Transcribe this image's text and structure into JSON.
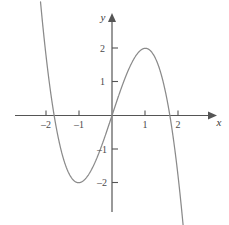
{
  "figure": {
    "background_color": "#ffffff",
    "axis_color": "#555555",
    "curve_color": "#8a8a8a",
    "tick_color": "#555555",
    "label_color": "#3a3a3a"
  },
  "axes": {
    "x_axis_label": "x",
    "y_axis_label": "y",
    "x_ticks": [
      {
        "label": "–2",
        "value": -2
      },
      {
        "label": "–1",
        "value": -1
      },
      {
        "label": "1",
        "value": 1
      },
      {
        "label": "2",
        "value": 2
      }
    ],
    "y_ticks": [
      {
        "label": "2",
        "value": 2
      },
      {
        "label": "1",
        "value": 1
      },
      {
        "label": "–1",
        "value": -1
      },
      {
        "label": "–2",
        "value": -2
      }
    ]
  },
  "chart_data": {
    "type": "line",
    "title": "",
    "subtitle": "",
    "xlabel": "x",
    "ylabel": "y",
    "xlim": [
      -2.9,
      3.1
    ],
    "ylim": [
      -3.3,
      3.2
    ],
    "grid": false,
    "legend": null,
    "series": [
      {
        "name": "y = 3x - x^3",
        "expression": "3x − x³",
        "color": "#8a8a8a",
        "x": [
          -1.74,
          -1.7,
          -1.65,
          -1.6,
          -1.55,
          -1.5,
          -1.45,
          -1.4,
          -1.35,
          -1.3,
          -1.25,
          -1.2,
          -1.15,
          -1.1,
          -1.05,
          -1.0,
          -0.95,
          -0.9,
          -0.85,
          -0.8,
          -0.75,
          -0.7,
          -0.65,
          -0.6,
          -0.55,
          -0.5,
          -0.45,
          -0.4,
          -0.35,
          -0.3,
          -0.25,
          -0.2,
          -0.15,
          -0.1,
          -0.05,
          0.0,
          0.05,
          0.1,
          0.15,
          0.2,
          0.25,
          0.3,
          0.35,
          0.4,
          0.45,
          0.5,
          0.55,
          0.6,
          0.65,
          0.7,
          0.75,
          0.8,
          0.85,
          0.9,
          0.95,
          1.0,
          1.05,
          1.1,
          1.15,
          1.2,
          1.25,
          1.3,
          1.35,
          1.4,
          1.45,
          1.5,
          1.55,
          1.6,
          1.65,
          1.7,
          1.75,
          1.8,
          1.85,
          1.9,
          1.95,
          2.0
        ],
        "y": [
          0.05,
          0.19,
          0.54,
          0.3,
          -0.0,
          -0.13,
          -0.3,
          -0.46,
          -0.59,
          -0.7,
          -0.8,
          -0.87,
          -0.93,
          -0.97,
          -0.99,
          -1.0,
          -0.99,
          -0.97,
          -0.94,
          -0.89,
          -0.83,
          -0.76,
          -0.68,
          -0.58,
          -0.48,
          -0.38,
          -0.26,
          -0.14,
          -0.01,
          0.12,
          0.25,
          0.39,
          0.52,
          0.65,
          0.78,
          0.0,
          0.15,
          0.3,
          0.45,
          0.59,
          0.73,
          0.87,
          1.01,
          1.14,
          1.26,
          1.38,
          1.48,
          1.58,
          1.68,
          1.76,
          1.83,
          1.89,
          1.94,
          1.97,
          1.99,
          2.0,
          1.99,
          1.97,
          1.93,
          1.87,
          1.8,
          1.7,
          1.59,
          1.46,
          1.3,
          1.13,
          0.93,
          0.7,
          0.46,
          0.19,
          -0.11,
          -0.43,
          -0.78,
          -1.16,
          -1.56,
          -2.0
        ],
        "key_points": [
          {
            "label": "local maximum",
            "x": 1,
            "y": 2
          },
          {
            "label": "local minimum",
            "x": -1,
            "y": -2
          },
          {
            "label": "root",
            "x": 0,
            "y": 0
          },
          {
            "label": "root",
            "x": 1.732,
            "y": 0
          },
          {
            "label": "root",
            "x": -1.732,
            "y": 0
          }
        ]
      }
    ]
  }
}
